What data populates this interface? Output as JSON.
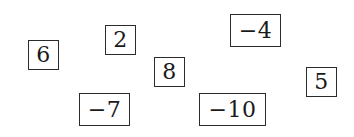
{
  "diagram": {
    "boxes": [
      {
        "value": "6",
        "x": 28,
        "y": 40,
        "w": 31,
        "h": 30
      },
      {
        "value": "2",
        "x": 105,
        "y": 25,
        "w": 31,
        "h": 30
      },
      {
        "value": "8",
        "x": 154,
        "y": 57,
        "w": 31,
        "h": 30
      },
      {
        "value": "−4",
        "x": 230,
        "y": 14,
        "w": 51,
        "h": 33
      },
      {
        "value": "−7",
        "x": 79,
        "y": 93,
        "w": 51,
        "h": 33
      },
      {
        "value": "−10",
        "x": 199,
        "y": 93,
        "w": 67,
        "h": 33
      },
      {
        "value": "5",
        "x": 306,
        "y": 67,
        "w": 31,
        "h": 30
      }
    ],
    "colors": {
      "border": "#2b2b2b",
      "text": "#1a1a1a",
      "background": "#ffffff"
    }
  }
}
